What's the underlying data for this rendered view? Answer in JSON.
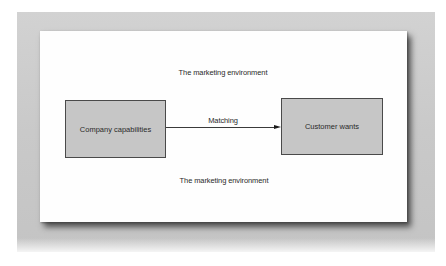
{
  "diagram": {
    "environment_top_label": "The marketing environment",
    "environment_bottom_label": "The marketing environment",
    "left_box": {
      "label": "Company capabilities"
    },
    "right_box": {
      "label": "Customer wants"
    },
    "connector": {
      "label": "Matching",
      "direction": "left-to-right"
    }
  },
  "colors": {
    "frame": "#c9c9c9",
    "panel": "#fefefe",
    "box_fill": "#c6c6c6",
    "box_border": "#4a4a4a",
    "text": "#2a2a2a"
  }
}
